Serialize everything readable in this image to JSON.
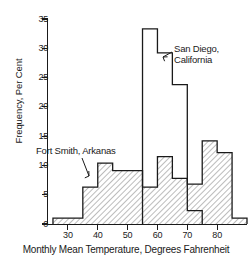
{
  "chart_data": {
    "type": "bar",
    "title": "",
    "subtitle": "",
    "xlabel": "Monthly Mean Temperature, Degrees Fahrenheit",
    "ylabel": "Frequency, Per Cent",
    "xlim": [
      23,
      90
    ],
    "ylim": [
      0,
      35
    ],
    "grid": false,
    "legend_position": "inline-annotations",
    "bin_width": 5,
    "bin_edges": [
      25,
      30,
      35,
      40,
      45,
      50,
      55,
      60,
      65,
      70,
      75,
      80,
      85,
      90
    ],
    "categories": [
      "25-30",
      "30-35",
      "35-40",
      "40-45",
      "45-50",
      "50-55",
      "55-60",
      "60-65",
      "65-70",
      "70-75",
      "75-80",
      "80-85",
      "85-90"
    ],
    "xticks": [
      30,
      40,
      50,
      60,
      70,
      80
    ],
    "xtick_labels": [
      "30",
      "40",
      "50",
      "60",
      "70",
      "80"
    ],
    "yticks": [
      0,
      5,
      10,
      15,
      20,
      25,
      30,
      35
    ],
    "ytick_labels": [
      "0",
      "5",
      "10",
      "15",
      "20",
      "25",
      "30",
      "35"
    ],
    "series": [
      {
        "name": "Fort Smith, Arkanas",
        "style": "hatched",
        "color": "#1a1a1a",
        "values": [
          1.0,
          1.0,
          6.3,
          10.4,
          9.1,
          9.1,
          6.3,
          11.5,
          7.8,
          6.8,
          14.2,
          12.2,
          1.0
        ]
      },
      {
        "name": "San Diego, California",
        "style": "outline",
        "color": "#1a1a1a",
        "values": [
          0,
          0,
          0,
          0,
          0,
          0,
          33.3,
          29.2,
          23.8,
          2.3,
          0,
          0,
          0
        ]
      }
    ],
    "annotations": [
      {
        "id": "san-diego",
        "text": "San Diego,\nCalifornia",
        "points_to_bin": "60-65"
      },
      {
        "id": "fort-smith",
        "text": "Fort Smith, Arkanas",
        "points_to_bin": "40-45"
      }
    ]
  }
}
